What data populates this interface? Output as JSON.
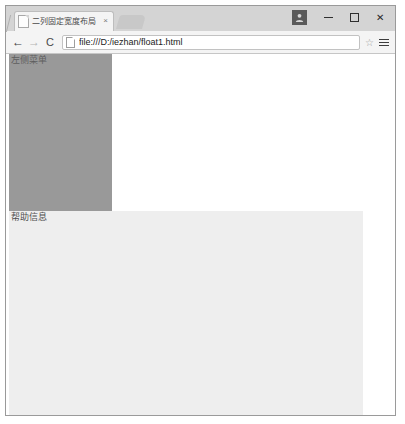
{
  "window": {
    "controls": {
      "avatar_icon": "user-avatar-icon",
      "minimize_label": "",
      "maximize_label": "",
      "close_label": "✕"
    }
  },
  "tabstrip": {
    "active_tab": {
      "title": "二列固定宽度布局",
      "favicon": "page-favicon-icon",
      "close_label": "×"
    },
    "new_tab_label": ""
  },
  "toolbar": {
    "back_label": "←",
    "forward_label": "→",
    "reload_label": "C",
    "omnibox": {
      "url": "file:///D:/iezhan/float1.html",
      "placeholder": "",
      "page_icon": "document-icon"
    },
    "bookmark_label": "☆",
    "menu_icon": "hamburger-menu-icon"
  },
  "page": {
    "sidebar": {
      "label": "左侧菜单",
      "color": "#999999"
    },
    "content": {
      "label": "",
      "color": "#ffffff"
    },
    "help": {
      "label": "帮助信息",
      "color": "#eeeeee"
    }
  }
}
